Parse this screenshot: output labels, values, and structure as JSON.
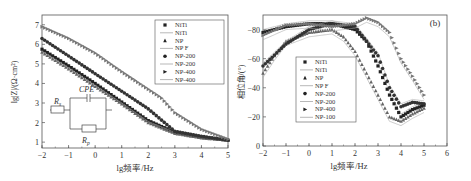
{
  "chart_data": [
    {
      "id": "a",
      "type": "scatter",
      "panel_label": "(a)",
      "title": "",
      "xlabel": "lg频率/Hz",
      "ylabel": "lg|Z|/(Ω·cm²)",
      "xlim": [
        -2,
        5
      ],
      "ylim": [
        0.7,
        7.5
      ],
      "xticks": [
        "-2",
        "-1",
        "0",
        "1",
        "2",
        "3",
        "4",
        "5"
      ],
      "yticks": [
        "1",
        "2",
        "3",
        "4",
        "5",
        "6",
        "7"
      ],
      "grid": false,
      "legend_position": "upper right",
      "legend": [
        "NiTi",
        "NiTi",
        "NP",
        "NP F",
        "NP-200",
        "NP-200",
        "NP-400",
        "NP-400"
      ],
      "inset_circuit": {
        "labels": [
          "Rs",
          "CPE",
          "Rp"
        ]
      },
      "series": [
        {
          "name": "NiTi",
          "marker": "square",
          "x": [
            -2,
            -1,
            0,
            1,
            2,
            3,
            4,
            5
          ],
          "y": [
            5.75,
            4.9,
            4.0,
            3.05,
            2.1,
            1.5,
            1.25,
            1.1
          ]
        },
        {
          "name": "NP",
          "marker": "triangle",
          "x": [
            -2,
            -1,
            0,
            1,
            2,
            3,
            4,
            5
          ],
          "y": [
            5.6,
            4.75,
            3.85,
            2.95,
            2.0,
            1.45,
            1.22,
            1.1
          ]
        },
        {
          "name": "NP-200",
          "marker": "circle",
          "x": [
            -2,
            -1,
            0,
            1,
            2,
            3,
            4,
            5
          ],
          "y": [
            6.3,
            5.4,
            4.5,
            3.6,
            2.7,
            1.55,
            1.3,
            1.1
          ]
        },
        {
          "name": "NP-400",
          "marker": "right-triangle",
          "x": [
            -2,
            -1,
            0,
            1,
            2,
            2.5,
            3,
            4,
            5
          ],
          "y": [
            6.9,
            6.3,
            5.55,
            4.6,
            3.7,
            3.25,
            2.5,
            1.65,
            1.15
          ]
        }
      ]
    },
    {
      "id": "b",
      "type": "scatter",
      "panel_label": "(b)",
      "title": "",
      "xlabel": "lg频率/Hz",
      "ylabel": "相位角/(°)",
      "xlim": [
        -2,
        6
      ],
      "ylim": [
        0,
        -90
      ],
      "xticks": [
        "-2",
        "-1",
        "0",
        "1",
        "2",
        "3",
        "4",
        "5",
        "6"
      ],
      "yticks": [
        "0",
        "-20",
        "-40",
        "-60",
        "-80"
      ],
      "grid": false,
      "legend_position": "center left",
      "legend": [
        "NiTi",
        "NiTi",
        "NP",
        "NP F",
        "NP-200",
        "NP-200",
        "NP-400",
        "NP-100"
      ],
      "series": [
        {
          "name": "NiTi",
          "marker": "square",
          "x": [
            -2,
            -1,
            0,
            1,
            2,
            2.5,
            3,
            3.5,
            4,
            4.5,
            5
          ],
          "y": [
            -78,
            -82,
            -84,
            -84,
            -80,
            -72,
            -55,
            -35,
            -20,
            -25,
            -28
          ]
        },
        {
          "name": "NP",
          "marker": "triangle",
          "x": [
            -2,
            -1.5,
            -1,
            0,
            1,
            1.5,
            2,
            2.5,
            3,
            3.5,
            4,
            4.5,
            5
          ],
          "y": [
            -50,
            -62,
            -72,
            -78,
            -80,
            -75,
            -65,
            -50,
            -35,
            -20,
            -17,
            -22,
            -26
          ]
        },
        {
          "name": "NP-200",
          "marker": "circle",
          "x": [
            -2,
            -1,
            0,
            1,
            2,
            2.5,
            3,
            3.5,
            4,
            4.5,
            5
          ],
          "y": [
            -55,
            -70,
            -80,
            -84,
            -82,
            -72,
            -62,
            -40,
            -27,
            -30,
            -29
          ]
        },
        {
          "name": "NP-400",
          "marker": "right-triangle",
          "x": [
            -2,
            -1,
            0,
            1,
            2,
            2.5,
            3,
            3.5,
            4,
            4.5,
            5
          ],
          "y": [
            -76,
            -83,
            -84,
            -82,
            -84,
            -88,
            -85,
            -78,
            -60,
            -48,
            -35
          ]
        }
      ]
    }
  ]
}
